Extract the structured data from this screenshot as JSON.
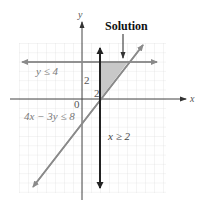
{
  "figure": {
    "title_annotation": "Solution",
    "axis_labels": {
      "x": "x",
      "y": "y"
    },
    "origin_label": "0",
    "tick_labels": {
      "y_tick": "2",
      "x_tick": "2"
    },
    "inequalities": [
      {
        "id": "y-le-4",
        "label": "y ≤ 4",
        "boundary": "y = 4",
        "style": "gray-double-arrow"
      },
      {
        "id": "4x-3y-le-8",
        "label": "4x − 3y ≤ 8",
        "boundary": "4x − 3y = 8",
        "style": "gray-double-arrow"
      },
      {
        "id": "x-ge-2",
        "label": "x ≥ 2",
        "boundary": "x = 2",
        "style": "black-thick-double-arrow"
      }
    ],
    "solution_region": {
      "vertices": [
        [
          2,
          4
        ],
        [
          5,
          4
        ],
        [
          2,
          0
        ]
      ],
      "fill": "#c8c8c8"
    },
    "colors": {
      "grid": "#d9d9d9",
      "axis": "#555555",
      "gray_line": "#8a8a8a",
      "black_line": "#222222",
      "shade": "#c8c8c8"
    }
  }
}
